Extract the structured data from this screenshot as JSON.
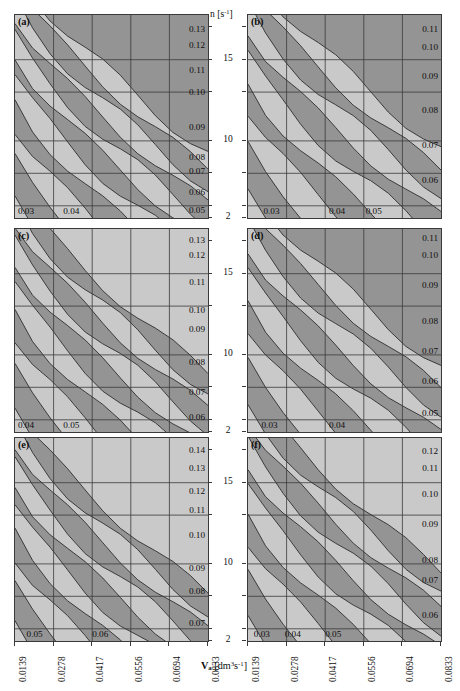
{
  "figure": {
    "axis_x_title_var": "V",
    "axis_x_title_sub": "a",
    "axis_x_title_unit": "[dm³s⁻¹]",
    "axis_y_title": "n [s⁻¹]",
    "bg_color": "#ffffff",
    "band_light": "#c9c9c9",
    "band_dark": "#949494",
    "line_color": "#3a3a3a"
  },
  "chart_data": {
    "type": "contour",
    "title": "",
    "xlabel": "V_a [dm3 s-1]",
    "ylabel": "n [s-1]",
    "xticks": [
      "0.0139",
      "0.0278",
      "0.0417",
      "0.0556",
      "0.0694",
      "0.0833"
    ],
    "xlim": [
      0.0139,
      0.0833
    ],
    "yticks": [
      "15",
      "10",
      "2"
    ],
    "ylim": [
      2,
      18
    ],
    "grid": true,
    "legend": "none",
    "shading": "alternating light/dark gray contour bands, values increase toward upper-right",
    "panels": [
      {
        "tag": "(a)",
        "levels": [
          "0.03",
          "0.04",
          "0.05",
          "0.06",
          "0.07",
          "0.08",
          "0.09",
          "0.10",
          "0.11",
          "0.12",
          "0.13"
        ],
        "right_labels": [
          "0.13",
          "0.12",
          "0.11",
          "0.10",
          "0.09",
          "0.08",
          "0.07",
          "0.06",
          "0.05"
        ],
        "bottom_labels": [
          "0.03",
          "0.04"
        ]
      },
      {
        "tag": "(b)",
        "levels": [
          "0.03",
          "0.04",
          "0.05",
          "0.06",
          "0.07",
          "0.08",
          "0.09",
          "0.10",
          "0.11"
        ],
        "right_labels": [
          "0.11",
          "0.10",
          "0.09",
          "0.08",
          "0.07",
          "0.06"
        ],
        "bottom_labels": [
          "0.03",
          "0.04",
          "0.05"
        ]
      },
      {
        "tag": "(c)",
        "levels": [
          "0.04",
          "0.05",
          "0.06",
          "0.07",
          "0.08",
          "0.09",
          "0.10",
          "0.11",
          "0.12",
          "0.13"
        ],
        "right_labels": [
          "0.13",
          "0.12",
          "0.11",
          "0.10",
          "0.09",
          "0.08",
          "0.07",
          "0.06"
        ],
        "bottom_labels": [
          "0.04",
          "0.05"
        ]
      },
      {
        "tag": "(d)",
        "levels": [
          "0.03",
          "0.04",
          "0.05",
          "0.06",
          "0.07",
          "0.08",
          "0.09",
          "0.10",
          "0.11"
        ],
        "right_labels": [
          "0.11",
          "0.10",
          "0.09",
          "0.08",
          "0.07",
          "0.06",
          "0.05"
        ],
        "bottom_labels": [
          "0.03",
          "0.04"
        ]
      },
      {
        "tag": "(e)",
        "levels": [
          "0.05",
          "0.06",
          "0.07",
          "0.08",
          "0.09",
          "0.10",
          "0.11",
          "0.12",
          "0.13",
          "0.14"
        ],
        "right_labels": [
          "0.14",
          "0.13",
          "0.12",
          "0.11",
          "0.10",
          "0.09",
          "0.08",
          "0.07"
        ],
        "bottom_labels": [
          "0.05",
          "0.06"
        ]
      },
      {
        "tag": "(f)",
        "levels": [
          "0.03",
          "0.04",
          "0.05",
          "0.06",
          "0.07",
          "0.08",
          "0.09",
          "0.10",
          "0.11",
          "0.12"
        ],
        "right_labels": [
          "0.12",
          "0.11",
          "0.10",
          "0.09",
          "0.08",
          "0.07",
          "0.06"
        ],
        "bottom_labels": [
          "0.03",
          "0.04",
          "0.05"
        ]
      }
    ]
  },
  "panels": {
    "a": {
      "tag": "(a)",
      "r0": "0.13",
      "r1": "0.12",
      "r2": "0.11",
      "r3": "0.10",
      "r4": "0.09",
      "r5": "0.08",
      "r6": "0.07",
      "r7": "0.06",
      "r8": "0.05",
      "b0": "0.03",
      "b1": "0.04"
    },
    "b": {
      "tag": "(b)",
      "r0": "0.11",
      "r1": "0.10",
      "r2": "0.09",
      "r3": "0.08",
      "r4": "0.07",
      "r5": "0.06",
      "b0": "0.03",
      "b1": "0.04",
      "b2": "0.05"
    },
    "c": {
      "tag": "(c)",
      "r0": "0.13",
      "r1": "0.12",
      "r2": "0.11",
      "r3": "0.10",
      "r4": "0.09",
      "r5": "0.08",
      "r6": "0.07",
      "r7": "0.06",
      "b0": "0.04",
      "b1": "0.05"
    },
    "d": {
      "tag": "(d)",
      "r0": "0.11",
      "r1": "0.10",
      "r2": "0.09",
      "r3": "0.08",
      "r4": "0.07",
      "r5": "0.06",
      "r6": "0.05",
      "b0": "0.03",
      "b1": "0.04"
    },
    "e": {
      "tag": "(e)",
      "r0": "0.14",
      "r1": "0.13",
      "r2": "0.12",
      "r3": "0.11",
      "r4": "0.10",
      "r5": "0.09",
      "r6": "0.08",
      "r7": "0.07",
      "b0": "0.05",
      "b1": "0.06"
    },
    "f": {
      "tag": "(f)",
      "r0": "0.12",
      "r1": "0.11",
      "r2": "0.10",
      "r3": "0.09",
      "r4": "0.08",
      "r5": "0.07",
      "r6": "0.06",
      "b0": "0.03",
      "b1": "0.04",
      "b2": "0.05"
    }
  },
  "yaxis": {
    "title": "n [s⁻¹]",
    "t15": "15",
    "t10": "10",
    "t2": "2"
  },
  "xaxis": {
    "t0": "0.0139",
    "t1": "0.0278",
    "t2": "0.0417",
    "t3": "0.0556",
    "t4": "0.0694",
    "t5": "0.0833"
  }
}
